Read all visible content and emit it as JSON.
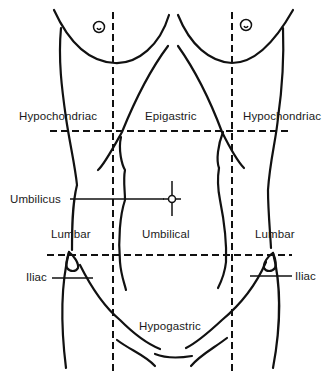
{
  "diagram": {
    "colors": {
      "line": "#111111",
      "background": "#ffffff",
      "text": "#1a1a1a"
    },
    "regions": {
      "upper_left": "Hypochondriac",
      "upper_center": "Epigastric",
      "upper_right": "Hypochondriac",
      "middle_left": "Lumbar",
      "middle_center": "Umbilical",
      "middle_right": "Lumbar",
      "lower_left": "Iliac",
      "lower_center": "Hypogastric",
      "lower_right": "Iliac"
    },
    "landmarks": {
      "umbilicus": "Umbilicus"
    },
    "icons": {
      "nipple_left": "nipple-icon",
      "nipple_right": "nipple-icon",
      "umbilicus_marker": "crosshair-icon"
    }
  }
}
